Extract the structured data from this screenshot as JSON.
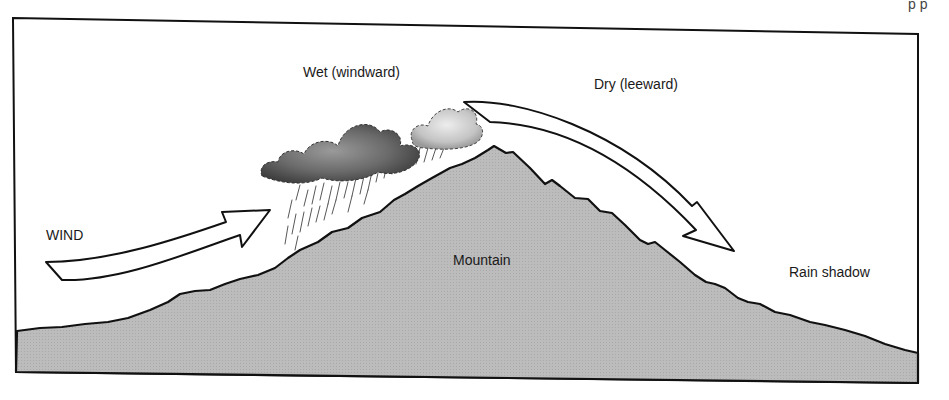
{
  "diagram": {
    "type": "orographic-precipitation",
    "colors": {
      "mountain_fill": "#b8b8b8",
      "outline": "#111111",
      "background": "#ffffff",
      "cloud_dark": "#555555",
      "cloud_light": "#d0d0d0"
    },
    "labels": {
      "windward": "Wet (windward)",
      "leeward": "Dry (leeward)",
      "wind": "WIND",
      "mountain": "Mountain",
      "rain_shadow": "Rain shadow"
    },
    "top_right_fragment": "p  p"
  }
}
